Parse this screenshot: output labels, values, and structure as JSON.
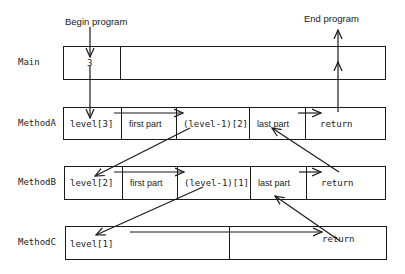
{
  "captions": {
    "begin": "Begin program",
    "end": "End program"
  },
  "rows": {
    "main": {
      "label": "Main",
      "cells": [
        "3",
        ""
      ]
    },
    "methodA": {
      "label": "MethodA",
      "cells": [
        "level[3]",
        "first part",
        "(level-1)[2]",
        "last part",
        "return"
      ]
    },
    "methodB": {
      "label": "MethodB",
      "cells": [
        "level[2]",
        "first part",
        "(level-1)[1]",
        "last part",
        "return"
      ]
    },
    "methodC": {
      "label": "MethodC",
      "cells": [
        "level[1]",
        "",
        "return"
      ]
    }
  },
  "colors": {
    "stroke": "#1a1a1a",
    "background": "#ffffff"
  }
}
